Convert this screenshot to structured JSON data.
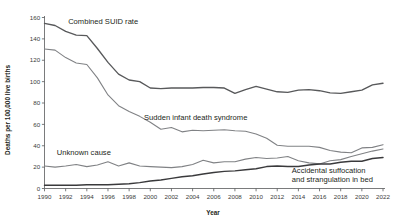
{
  "chart_data": {
    "type": "line",
    "title": "",
    "xlabel": "Year",
    "ylabel": "Deaths per 100,000 live births",
    "xlim": [
      1990,
      2022
    ],
    "ylim": [
      0,
      160
    ],
    "grid": false,
    "legend_position": "inline-annotations",
    "x": [
      1990,
      1991,
      1992,
      1993,
      1994,
      1995,
      1996,
      1997,
      1998,
      1999,
      2000,
      2001,
      2002,
      2003,
      2004,
      2005,
      2006,
      2007,
      2008,
      2009,
      2010,
      2011,
      2012,
      2013,
      2014,
      2015,
      2016,
      2017,
      2018,
      2019,
      2020,
      2021,
      2022
    ],
    "xticks": [
      1990,
      1992,
      1994,
      1996,
      1998,
      2000,
      2002,
      2004,
      2006,
      2008,
      2010,
      2012,
      2014,
      2016,
      2018,
      2020,
      2022
    ],
    "xtick_labels": [
      "1990",
      "1992",
      "1994",
      "1996",
      "1998",
      "2000",
      "2002",
      "2004",
      "2006",
      "2008",
      "2010",
      "2012",
      "2014",
      "2016",
      "2018",
      "2020",
      "2022"
    ],
    "yticks": [
      0,
      20,
      40,
      60,
      80,
      100,
      120,
      140,
      160
    ],
    "ytick_labels": [
      "0",
      "20",
      "40",
      "60",
      "80",
      "100",
      "120",
      "140",
      "160"
    ],
    "series": [
      {
        "name": "Combined SUID rate",
        "color": "#58595b",
        "width": 1.35,
        "label_x": 1991.1,
        "label_y": 156,
        "values": [
          154.5,
          152.5,
          147.0,
          143.5,
          143.0,
          131.0,
          118.0,
          107.0,
          101.5,
          100.0,
          94.0,
          93.5,
          94.0,
          94.0,
          94.0,
          94.5,
          94.5,
          94.0,
          89.0,
          92.5,
          95.5,
          93.0,
          90.5,
          90.0,
          92.0,
          92.5,
          91.5,
          89.5,
          89.0,
          90.5,
          92.0,
          97.0,
          98.5
        ]
      },
      {
        "name": "Sudden infant death syndrome",
        "color": "#808285",
        "width": 1.1,
        "label_x": 1999.4,
        "label_y": 64,
        "values": [
          130.5,
          129.5,
          122.5,
          117.5,
          116.0,
          103.5,
          87.5,
          77.5,
          72.0,
          67.5,
          62.0,
          55.5,
          57.0,
          53.0,
          54.5,
          54.0,
          54.5,
          55.0,
          54.0,
          53.5,
          51.0,
          47.0,
          40.5,
          39.5,
          39.5,
          39.5,
          38.5,
          35.5,
          34.0,
          33.5,
          38.0,
          38.5,
          41.0
        ]
      },
      {
        "name": "Unknown cause",
        "color": "#808285",
        "width": 1.1,
        "label_x": 1990.6,
        "label_y": 31,
        "values": [
          21.0,
          20.0,
          21.0,
          22.5,
          20.5,
          22.0,
          25.0,
          21.0,
          24.0,
          21.0,
          20.5,
          20.0,
          19.5,
          20.5,
          22.5,
          26.5,
          24.0,
          25.0,
          25.0,
          27.5,
          29.0,
          28.0,
          28.5,
          30.0,
          26.0,
          24.0,
          23.0,
          26.0,
          27.0,
          30.0,
          32.5,
          35.0,
          37.0
        ]
      },
      {
        "name": "Accidental suffocation and strangulation in bed",
        "color": "#3a3a3c",
        "width": 1.45,
        "label_x": 2013.0,
        "label_y": 15,
        "values": [
          3.0,
          3.0,
          3.0,
          3.0,
          3.5,
          3.5,
          3.5,
          4.0,
          4.5,
          5.5,
          7.0,
          8.0,
          9.5,
          11.0,
          12.0,
          13.5,
          15.0,
          16.0,
          16.5,
          17.5,
          18.5,
          20.5,
          21.0,
          20.5,
          20.5,
          22.0,
          23.0,
          23.0,
          24.5,
          25.5,
          25.5,
          28.0,
          29.0
        ]
      }
    ],
    "annotations": [
      {
        "id": "combined-suid-rate",
        "text": "Combined SUID rate"
      },
      {
        "id": "sids",
        "text": "Sudden infant death syndrome"
      },
      {
        "id": "unknown-cause",
        "text": "Unknown cause"
      },
      {
        "id": "asphyxia-line1",
        "text": "Accidental suffocation"
      },
      {
        "id": "asphyxia-line2",
        "text": "and strangulation in bed"
      }
    ]
  }
}
